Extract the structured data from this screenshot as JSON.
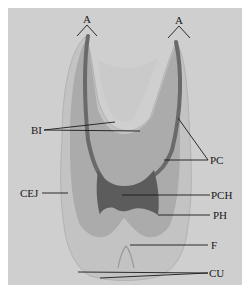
{
  "figure": {
    "type": "tooth cross-section diagram",
    "labels": {
      "apex_left": "A",
      "apex_right": "A",
      "bl": "BI",
      "pc": "PC",
      "cej": "CEJ",
      "pch": "PCH",
      "ph": "PH",
      "f": "F",
      "cu": "CU"
    },
    "colors": {
      "background": "#cfcfcf",
      "outer_enamel": "#bdbdbd",
      "dentin": "#a9a9a9",
      "pulp_canal": "#6e6e6e",
      "pulp_chamber": "#5f5f5f",
      "label_line": "#1a1a1a"
    }
  }
}
